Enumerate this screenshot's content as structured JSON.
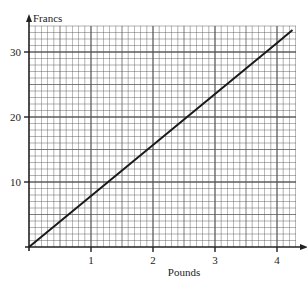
{
  "chart_data": {
    "type": "line",
    "title": "",
    "xlabel": "Pounds",
    "ylabel": "Francs",
    "x_ticks": [
      "1",
      "2",
      "3",
      "4"
    ],
    "y_ticks": [
      "10",
      "20",
      "30"
    ],
    "xlim": [
      0,
      4.25
    ],
    "ylim": [
      0,
      34
    ],
    "grid": true,
    "legend": null,
    "series": [
      {
        "name": "Pounds to Francs conversion",
        "x": [
          0,
          1,
          2,
          3,
          4,
          4.25
        ],
        "y": [
          0,
          7.85,
          15.7,
          23.55,
          31.4,
          33.4
        ]
      }
    ]
  },
  "colors": {
    "grid": "#555555",
    "axis": "#222222",
    "line": "#1a1a1a",
    "background": "#ffffff"
  }
}
